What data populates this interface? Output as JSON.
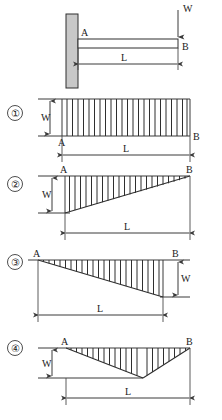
{
  "figure": {
    "colors": {
      "ink": "#2f2f2f",
      "line": "#3a3a3a",
      "wall_fill": "#c8c8c8",
      "beam_fill": "#ffffff",
      "background": "#ffffff"
    },
    "labels": {
      "load": "W",
      "length": "L",
      "fixed_end": "A",
      "free_end": "B"
    },
    "beam": {
      "name": "cantilever-beam",
      "support": "fixed-wall-left",
      "load_position": "free-end-right",
      "load_label": "W",
      "span_label": "L",
      "left_node_label": "A",
      "right_node_label": "B"
    },
    "options": [
      {
        "number": "①",
        "id": "option-1",
        "shape": "uniform-rectangle",
        "description": "Constant magnitude W over full span L",
        "amplitude_label": "W",
        "span_label": "L",
        "left_label": "A",
        "right_label": "B",
        "dimension_side": "left",
        "hatch_count": 23
      },
      {
        "number": "②",
        "id": "option-2",
        "shape": "triangle-max-at-left",
        "description": "Linear taper from W at A to zero at B, below baseline",
        "amplitude_label": "W",
        "span_label": "L",
        "left_label": "A",
        "right_label": "B",
        "dimension_side": "left",
        "hatch_count": 22
      },
      {
        "number": "③",
        "id": "option-3",
        "shape": "triangle-max-at-right",
        "description": "Linear taper from zero at A to W at B, below baseline",
        "amplitude_label": "W",
        "span_label": "L",
        "left_label": "A",
        "right_label": "B",
        "dimension_side": "right",
        "hatch_count": 22
      },
      {
        "number": "④",
        "id": "option-4",
        "shape": "v-shape-apex-mid",
        "description": "Zero at A, maximum W at interior apex, back to zero at B",
        "amplitude_label": "W",
        "span_label": "L",
        "left_label": "A",
        "right_label": "B",
        "dimension_side": "left",
        "hatch_count": 20
      }
    ]
  }
}
